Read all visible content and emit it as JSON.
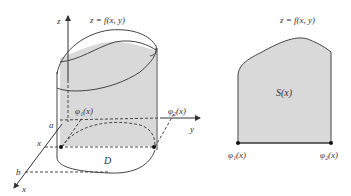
{
  "left_figure": {
    "surface_label": "z = f(x, y)",
    "axis_z": "z",
    "axis_y": "y",
    "axis_x": "x",
    "label_a": "a",
    "label_b": "b",
    "label_x": "x",
    "phi1": "φ₁(x)",
    "phi2": "φ₂(x)",
    "region": "D"
  },
  "right_figure": {
    "surface_label": "z = f(x, y)",
    "area_label": "S(x)",
    "phi1": "φ₁(x)",
    "phi2": "φ₂(x)"
  },
  "colors": {
    "fill": "#d9d9d9",
    "stroke": "#444444"
  }
}
